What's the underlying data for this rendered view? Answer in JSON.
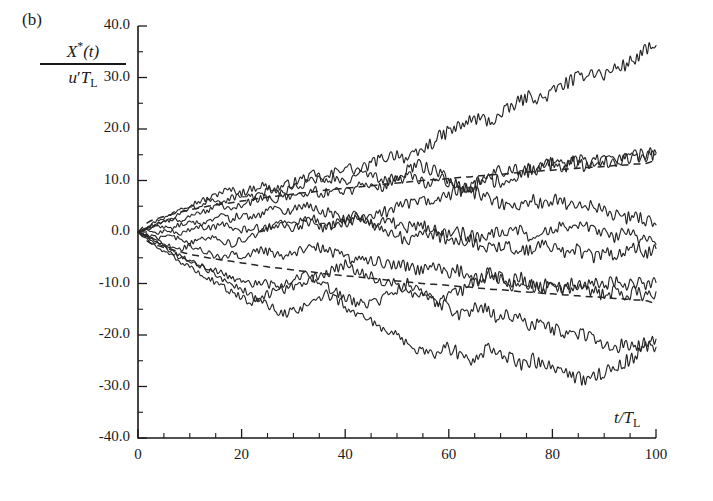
{
  "panel": {
    "label": "(b)"
  },
  "axes": {
    "y_label_numerator": "X*(t)",
    "y_label_denominator": "u′T_L",
    "y_label_num_base": "X",
    "y_label_num_star": "*",
    "y_label_num_arg": "(t)",
    "y_label_den_u": "u",
    "y_label_den_prime": "′",
    "y_label_den_T": "T",
    "y_label_den_sub": "L",
    "x_label": "t/T_L",
    "x_label_t": "t/",
    "x_label_T": "T",
    "x_label_sub": "L",
    "y_ticks": [
      "40.0",
      "30.0",
      "20.0",
      "10.0",
      "0.0",
      "-10.0",
      "-20.0",
      "-30.0",
      "-40.0"
    ],
    "x_ticks": [
      "0",
      "20",
      "40",
      "60",
      "80",
      "100"
    ],
    "y_min": -40.0,
    "y_max": 40.0,
    "x_min": 0,
    "x_max": 100,
    "y_major_step": 10.0,
    "y_minor_step": 5.0,
    "x_major_step": 20,
    "x_minor_step": 5,
    "grid": false
  },
  "colors": {
    "axis": "#1a1a1a",
    "trajectory": "#262626",
    "envelope": "#262626",
    "background": "#ffffff"
  },
  "chart_data": {
    "type": "line",
    "title": "",
    "subtitle": "",
    "xlabel": "t/T_L",
    "ylabel": "X*(t)/(u′T_L)",
    "xlim": [
      0,
      100
    ],
    "ylim": [
      -40.0,
      40.0
    ],
    "grid": false,
    "legend": "none",
    "annotations": [
      "(b)"
    ],
    "x": [
      0,
      2,
      4,
      6,
      8,
      10,
      12,
      14,
      16,
      18,
      20,
      22,
      24,
      26,
      28,
      30,
      32,
      34,
      36,
      38,
      40,
      42,
      44,
      46,
      48,
      50,
      52,
      54,
      56,
      58,
      60,
      62,
      64,
      66,
      68,
      70,
      72,
      74,
      76,
      78,
      80,
      82,
      84,
      86,
      88,
      90,
      92,
      94,
      96,
      98,
      100
    ],
    "series": [
      {
        "name": "trajectory-1",
        "style": "solid",
        "values": [
          0.0,
          1.2,
          2.4,
          3.1,
          4.6,
          5.3,
          6.0,
          6.6,
          7.8,
          8.2,
          7.6,
          8.4,
          9.1,
          8.2,
          8.9,
          9.6,
          10.4,
          11.1,
          10.2,
          11.6,
          12.8,
          11.9,
          12.6,
          13.8,
          14.6,
          15.3,
          14.1,
          15.2,
          16.8,
          18.2,
          19.6,
          20.4,
          21.6,
          22.1,
          21.4,
          22.6,
          24.2,
          25.6,
          26.4,
          25.8,
          27.2,
          28.6,
          29.4,
          30.6,
          31.2,
          30.4,
          31.8,
          32.4,
          33.6,
          35.2,
          36.2
        ]
      },
      {
        "name": "trajectory-2",
        "style": "solid",
        "values": [
          0.0,
          0.8,
          1.6,
          2.2,
          3.4,
          4.6,
          5.2,
          6.4,
          5.8,
          6.6,
          7.4,
          6.8,
          7.6,
          8.4,
          7.8,
          8.6,
          9.4,
          10.2,
          9.6,
          10.4,
          9.6,
          10.6,
          11.4,
          10.8,
          9.8,
          10.6,
          11.8,
          13.2,
          12.4,
          11.6,
          10.4,
          9.2,
          8.4,
          9.6,
          10.8,
          12.2,
          11.4,
          12.6,
          11.8,
          12.4,
          13.2,
          12.4,
          13.6,
          12.8,
          13.4,
          14.2,
          13.4,
          14.2,
          14.8,
          14.2,
          15.2
        ]
      },
      {
        "name": "trajectory-3",
        "style": "solid",
        "values": [
          0.0,
          1.0,
          1.8,
          2.6,
          2.0,
          2.8,
          3.6,
          4.4,
          5.2,
          4.4,
          5.2,
          6.0,
          6.8,
          6.2,
          7.0,
          6.4,
          7.2,
          8.0,
          7.4,
          8.2,
          7.6,
          8.4,
          9.2,
          8.6,
          9.4,
          10.2,
          11.0,
          10.4,
          9.6,
          10.4,
          9.6,
          8.8,
          8.0,
          7.2,
          6.4,
          5.6,
          4.8,
          5.6,
          6.4,
          5.6,
          6.4,
          5.6,
          4.8,
          5.6,
          4.8,
          4.0,
          3.2,
          2.4,
          3.2,
          2.4,
          1.4
        ]
      },
      {
        "name": "trajectory-4",
        "style": "solid",
        "values": [
          0.0,
          0.6,
          1.2,
          0.6,
          1.4,
          2.2,
          1.6,
          2.4,
          3.2,
          2.6,
          3.4,
          2.8,
          3.6,
          4.4,
          3.8,
          4.6,
          5.4,
          4.8,
          4.0,
          3.2,
          2.4,
          3.2,
          2.4,
          1.6,
          2.4,
          1.6,
          0.8,
          1.6,
          0.8,
          0.0,
          -0.8,
          0.0,
          -0.8,
          -1.6,
          -0.8,
          0.0,
          0.8,
          0.0,
          -0.8,
          0.0,
          0.8,
          1.6,
          0.8,
          1.6,
          0.8,
          0.0,
          -0.8,
          0.0,
          -0.8,
          -1.6,
          -2.4
        ]
      },
      {
        "name": "trajectory-5",
        "style": "solid",
        "values": [
          0.0,
          0.4,
          -0.2,
          0.4,
          -0.4,
          0.4,
          1.2,
          0.6,
          1.4,
          0.8,
          0.2,
          1.0,
          0.4,
          1.2,
          2.0,
          1.4,
          2.2,
          1.6,
          0.8,
          1.6,
          2.4,
          3.2,
          2.4,
          3.2,
          4.0,
          4.8,
          5.6,
          6.4,
          5.6,
          6.4,
          7.2,
          8.0,
          8.8,
          9.6,
          10.4,
          9.6,
          10.4,
          11.2,
          12.0,
          12.8,
          13.6,
          12.8,
          13.6,
          14.4,
          13.6,
          14.4,
          13.6,
          14.4,
          15.2,
          14.6,
          15.4
        ]
      },
      {
        "name": "trajectory-6",
        "style": "solid",
        "values": [
          0.0,
          -0.6,
          -1.2,
          -0.6,
          -1.4,
          -2.2,
          -1.6,
          -0.8,
          -1.6,
          -2.4,
          -1.6,
          -0.8,
          0.0,
          0.8,
          1.6,
          0.8,
          1.6,
          2.4,
          1.6,
          0.8,
          1.6,
          2.4,
          1.6,
          0.8,
          0.0,
          -0.8,
          -1.6,
          -0.8,
          0.0,
          -0.8,
          -1.6,
          -2.4,
          -1.6,
          -2.4,
          -3.2,
          -2.4,
          -3.2,
          -4.0,
          -3.2,
          -2.4,
          -3.2,
          -4.0,
          -3.2,
          -4.0,
          -4.8,
          -4.0,
          -4.8,
          -4.0,
          -3.2,
          -4.0,
          -3.2
        ]
      },
      {
        "name": "trajectory-7",
        "style": "solid",
        "values": [
          0.0,
          -0.8,
          -1.8,
          -2.6,
          -3.4,
          -2.6,
          -3.4,
          -4.2,
          -5.0,
          -4.2,
          -5.0,
          -4.2,
          -3.4,
          -4.2,
          -5.0,
          -4.2,
          -3.4,
          -2.6,
          -3.4,
          -4.2,
          -5.0,
          -5.8,
          -5.0,
          -5.8,
          -6.6,
          -5.8,
          -6.6,
          -7.4,
          -6.6,
          -7.4,
          -8.2,
          -7.4,
          -8.2,
          -9.0,
          -8.2,
          -9.0,
          -9.8,
          -9.0,
          -9.8,
          -10.6,
          -9.8,
          -10.6,
          -9.8,
          -10.6,
          -9.8,
          -10.6,
          -9.8,
          -10.6,
          -9.8,
          -10.6,
          -9.8
        ]
      },
      {
        "name": "trajectory-8",
        "style": "solid",
        "values": [
          0.0,
          -1.2,
          -2.4,
          -3.6,
          -4.8,
          -5.6,
          -6.4,
          -7.2,
          -8.0,
          -8.8,
          -9.6,
          -10.4,
          -9.6,
          -10.4,
          -11.2,
          -10.4,
          -9.6,
          -8.8,
          -8.0,
          -7.2,
          -6.4,
          -7.2,
          -8.0,
          -8.8,
          -9.6,
          -10.4,
          -11.2,
          -12.0,
          -12.8,
          -13.6,
          -12.8,
          -11.6,
          -10.4,
          -9.2,
          -8.0,
          -9.2,
          -10.4,
          -9.6,
          -10.4,
          -11.2,
          -10.4,
          -11.2,
          -10.4,
          -11.2,
          -11.6,
          -12.4,
          -11.6,
          -12.4,
          -11.6,
          -12.4,
          -11.6
        ]
      },
      {
        "name": "trajectory-9",
        "style": "solid",
        "values": [
          0.0,
          -1.6,
          -3.2,
          -4.4,
          -5.6,
          -6.8,
          -8.0,
          -9.2,
          -10.4,
          -11.6,
          -12.8,
          -13.6,
          -12.8,
          -11.6,
          -10.4,
          -9.2,
          -8.0,
          -9.2,
          -10.4,
          -11.6,
          -12.8,
          -13.6,
          -14.4,
          -13.6,
          -12.4,
          -11.2,
          -10.0,
          -11.2,
          -12.4,
          -13.6,
          -14.8,
          -16.0,
          -15.2,
          -14.4,
          -15.6,
          -16.8,
          -16.0,
          -17.2,
          -18.4,
          -17.6,
          -18.8,
          -19.6,
          -20.4,
          -19.6,
          -20.4,
          -21.6,
          -22.4,
          -21.6,
          -22.4,
          -21.6,
          -22.4
        ]
      },
      {
        "name": "trajectory-10",
        "style": "solid",
        "values": [
          0.0,
          -1.0,
          -2.0,
          -3.2,
          -4.4,
          -5.6,
          -6.4,
          -7.6,
          -8.8,
          -10.0,
          -11.2,
          -12.4,
          -13.6,
          -14.8,
          -16.0,
          -15.2,
          -14.4,
          -13.2,
          -12.0,
          -13.2,
          -14.4,
          -15.6,
          -16.8,
          -18.0,
          -19.2,
          -20.4,
          -21.6,
          -22.8,
          -24.0,
          -23.2,
          -22.4,
          -23.6,
          -24.8,
          -23.6,
          -22.4,
          -23.6,
          -24.8,
          -25.6,
          -24.8,
          -25.6,
          -26.4,
          -27.2,
          -28.0,
          -28.8,
          -28.0,
          -27.2,
          -26.4,
          -25.2,
          -24.0,
          -22.4,
          -20.8
        ]
      },
      {
        "name": "envelope-upper",
        "style": "dashed",
        "description": "+sigma dispersion envelope, grows as sqrt(t)",
        "values": [
          0.0,
          1.9,
          2.7,
          3.3,
          3.8,
          4.3,
          4.7,
          5.1,
          5.4,
          5.7,
          6.0,
          6.3,
          6.6,
          6.9,
          7.1,
          7.4,
          7.6,
          7.8,
          8.1,
          8.3,
          8.5,
          8.7,
          8.9,
          9.1,
          9.3,
          9.5,
          9.7,
          9.9,
          10.1,
          10.2,
          10.4,
          10.6,
          10.7,
          10.9,
          11.1,
          11.2,
          11.4,
          11.6,
          11.7,
          11.9,
          12.0,
          12.2,
          12.3,
          12.5,
          12.6,
          12.7,
          12.9,
          13.0,
          13.2,
          13.3,
          14.0
        ]
      },
      {
        "name": "envelope-lower",
        "style": "dashed",
        "description": "-sigma dispersion envelope, grows as sqrt(t)",
        "values": [
          0.0,
          -1.9,
          -2.7,
          -3.3,
          -3.8,
          -4.3,
          -4.7,
          -5.1,
          -5.4,
          -5.7,
          -6.0,
          -6.3,
          -6.6,
          -6.9,
          -7.1,
          -7.4,
          -7.6,
          -7.8,
          -8.1,
          -8.3,
          -8.5,
          -8.7,
          -8.9,
          -9.1,
          -9.3,
          -9.5,
          -9.7,
          -9.9,
          -10.1,
          -10.2,
          -10.4,
          -10.6,
          -10.7,
          -10.9,
          -11.1,
          -11.2,
          -11.4,
          -11.6,
          -11.7,
          -11.9,
          -12.0,
          -12.2,
          -12.3,
          -12.5,
          -12.6,
          -12.7,
          -12.9,
          -13.0,
          -13.2,
          -13.3,
          -14.0
        ]
      }
    ]
  }
}
